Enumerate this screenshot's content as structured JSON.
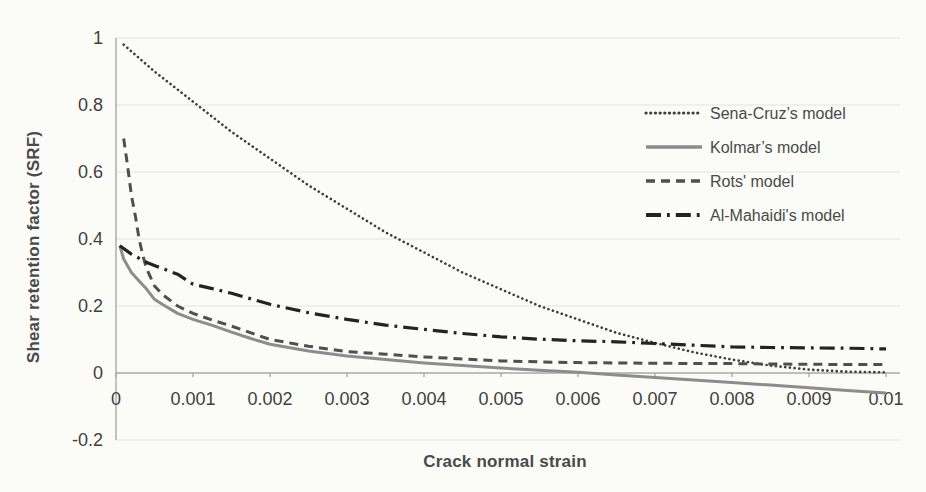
{
  "figure": {
    "background_color": "#fbfbf8",
    "axis_color": "#a9a9a6",
    "grid_color": "#e4e4de",
    "text_color": "#3f3f3f"
  },
  "chart_data": {
    "type": "line",
    "title": "",
    "xlabel": "Crack normal strain",
    "ylabel": "Shear retention factor (SRF)",
    "xlim": [
      0,
      0.01
    ],
    "ylim": [
      -0.2,
      1
    ],
    "x_tick_labels": [
      "0",
      "0.001",
      "0.002",
      "0.003",
      "0.004",
      "0.005",
      "0.006",
      "0.007",
      "0.008",
      "0.009",
      "0.01"
    ],
    "y_tick_labels": [
      "1",
      "0.8",
      "0.6",
      "0.4",
      "0.2",
      "0",
      "-0.2"
    ],
    "grid": "horizontal-only",
    "legend_position": "inside-upper-right",
    "series": [
      {
        "name": "Sena-Cruz’s model",
        "line_style": "dotted",
        "color": "#3d3d3d",
        "points": [
          [
            0.0001,
            0.98
          ],
          [
            0.0005,
            0.9
          ],
          [
            0.001,
            0.81
          ],
          [
            0.0015,
            0.72
          ],
          [
            0.002,
            0.64
          ],
          [
            0.0025,
            0.56
          ],
          [
            0.003,
            0.49
          ],
          [
            0.0035,
            0.42
          ],
          [
            0.004,
            0.36
          ],
          [
            0.0045,
            0.3
          ],
          [
            0.005,
            0.25
          ],
          [
            0.0055,
            0.2
          ],
          [
            0.006,
            0.16
          ],
          [
            0.0065,
            0.12
          ],
          [
            0.007,
            0.09
          ],
          [
            0.0075,
            0.062
          ],
          [
            0.008,
            0.04
          ],
          [
            0.0085,
            0.022
          ],
          [
            0.009,
            0.01
          ],
          [
            0.0095,
            0.004
          ],
          [
            0.01,
            0.002
          ]
        ]
      },
      {
        "name": "Kolmar’s model",
        "line_style": "solid",
        "color": "#8c8c8c",
        "points": [
          [
            5e-05,
            0.38
          ],
          [
            0.0001,
            0.34
          ],
          [
            0.0002,
            0.3
          ],
          [
            0.0003,
            0.275
          ],
          [
            0.0004,
            0.25
          ],
          [
            0.0005,
            0.22
          ],
          [
            0.0006,
            0.205
          ],
          [
            0.0008,
            0.178
          ],
          [
            0.001,
            0.16
          ],
          [
            0.00125,
            0.142
          ],
          [
            0.0015,
            0.122
          ],
          [
            0.00175,
            0.103
          ],
          [
            0.002,
            0.086
          ],
          [
            0.0025,
            0.066
          ],
          [
            0.003,
            0.051
          ],
          [
            0.0035,
            0.04
          ],
          [
            0.004,
            0.03
          ],
          [
            0.0045,
            0.022
          ],
          [
            0.005,
            0.015
          ],
          [
            0.0055,
            0.008
          ],
          [
            0.006,
            0.002
          ],
          [
            0.0065,
            -0.006
          ],
          [
            0.007,
            -0.013
          ],
          [
            0.0075,
            -0.021
          ],
          [
            0.008,
            -0.028
          ],
          [
            0.0085,
            -0.036
          ],
          [
            0.009,
            -0.044
          ],
          [
            0.0095,
            -0.052
          ],
          [
            0.01,
            -0.06
          ]
        ]
      },
      {
        "name": "Rots' model",
        "line_style": "dashed",
        "color": "#4f4f4f",
        "points": [
          [
            0.0001,
            0.7
          ],
          [
            0.00015,
            0.62
          ],
          [
            0.0002,
            0.53
          ],
          [
            0.00025,
            0.47
          ],
          [
            0.0003,
            0.4
          ],
          [
            0.00035,
            0.35
          ],
          [
            0.0004,
            0.31
          ],
          [
            0.0005,
            0.26
          ],
          [
            0.0006,
            0.235
          ],
          [
            0.0008,
            0.2
          ],
          [
            0.001,
            0.178
          ],
          [
            0.00125,
            0.158
          ],
          [
            0.0015,
            0.14
          ],
          [
            0.002,
            0.1
          ],
          [
            0.0025,
            0.08
          ],
          [
            0.003,
            0.064
          ],
          [
            0.0035,
            0.056
          ],
          [
            0.004,
            0.048
          ],
          [
            0.0045,
            0.042
          ],
          [
            0.005,
            0.036
          ],
          [
            0.0055,
            0.033
          ],
          [
            0.006,
            0.031
          ],
          [
            0.007,
            0.029
          ],
          [
            0.008,
            0.028
          ],
          [
            0.009,
            0.026
          ],
          [
            0.01,
            0.025
          ]
        ]
      },
      {
        "name": "Al-Mahaidi's model",
        "line_style": "dash-dot",
        "color": "#232323",
        "points": [
          [
            5e-05,
            0.38
          ],
          [
            0.0002,
            0.355
          ],
          [
            0.0004,
            0.33
          ],
          [
            0.0006,
            0.312
          ],
          [
            0.0008,
            0.295
          ],
          [
            0.001,
            0.265
          ],
          [
            0.00125,
            0.252
          ],
          [
            0.0015,
            0.238
          ],
          [
            0.002,
            0.205
          ],
          [
            0.0025,
            0.18
          ],
          [
            0.003,
            0.16
          ],
          [
            0.0035,
            0.143
          ],
          [
            0.004,
            0.13
          ],
          [
            0.0045,
            0.118
          ],
          [
            0.005,
            0.108
          ],
          [
            0.0055,
            0.101
          ],
          [
            0.006,
            0.096
          ],
          [
            0.0065,
            0.093
          ],
          [
            0.007,
            0.088
          ],
          [
            0.0075,
            0.083
          ],
          [
            0.008,
            0.078
          ],
          [
            0.0085,
            0.076
          ],
          [
            0.009,
            0.075
          ],
          [
            0.0095,
            0.074
          ],
          [
            0.01,
            0.072
          ]
        ]
      }
    ]
  }
}
